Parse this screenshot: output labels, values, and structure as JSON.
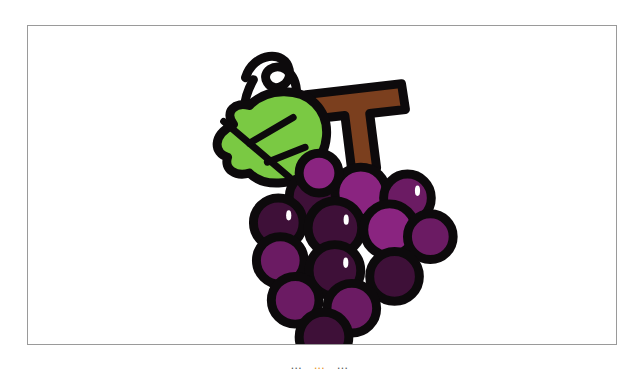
{
  "canvas": {
    "width": 639,
    "height": 373,
    "background_color": "#ffffff"
  },
  "image_card": {
    "name": "grape illustration card",
    "border_color": "#9a9a9a",
    "background_color": "#ffffff",
    "x": 27,
    "y": 25,
    "width": 590,
    "height": 320
  },
  "illustration": {
    "subject": "grapes",
    "style": "flat clipart with heavy black outline",
    "alt_text": "Bunch of purple grapes with a green leaf, curly tendril and brown T-shaped stem",
    "colors": {
      "outline": "#0d0a0c",
      "leaf_green": "#7ac943",
      "stem_brown": "#7b3f1e",
      "grape_dark": "#3e1038",
      "grape_mid": "#6b1b63",
      "grape_light": "#8a2480",
      "highlight": "#ffffff"
    },
    "parts": [
      {
        "label": "tendril",
        "color": "#0d0a0c"
      },
      {
        "label": "leaf",
        "color": "#7ac943"
      },
      {
        "label": "stem",
        "color": "#7b3f1e"
      },
      {
        "label": "grape cluster",
        "color": "#6b1b63"
      }
    ],
    "grapes": [
      {
        "cx": 286,
        "cy": 172,
        "r": 24,
        "tone": "grape_dark",
        "highlight": true
      },
      {
        "cx": 334,
        "cy": 168,
        "r": 26,
        "tone": "grape_light",
        "highlight": false
      },
      {
        "cx": 381,
        "cy": 173,
        "r": 24,
        "tone": "grape_mid",
        "highlight": true
      },
      {
        "cx": 251,
        "cy": 198,
        "r": 25,
        "tone": "grape_dark",
        "highlight": true
      },
      {
        "cx": 308,
        "cy": 203,
        "r": 27,
        "tone": "grape_dark",
        "highlight": true
      },
      {
        "cx": 363,
        "cy": 205,
        "r": 26,
        "tone": "grape_light",
        "highlight": false
      },
      {
        "cx": 404,
        "cy": 212,
        "r": 23,
        "tone": "grape_mid",
        "highlight": false
      },
      {
        "cx": 253,
        "cy": 236,
        "r": 24,
        "tone": "grape_mid",
        "highlight": false
      },
      {
        "cx": 308,
        "cy": 246,
        "r": 26,
        "tone": "grape_dark",
        "highlight": true
      },
      {
        "cx": 368,
        "cy": 252,
        "r": 25,
        "tone": "grape_dark",
        "highlight": false
      },
      {
        "cx": 268,
        "cy": 276,
        "r": 24,
        "tone": "grape_mid",
        "highlight": false
      },
      {
        "cx": 325,
        "cy": 284,
        "r": 25,
        "tone": "grape_mid",
        "highlight": false
      },
      {
        "cx": 297,
        "cy": 313,
        "r": 25,
        "tone": "grape_dark",
        "highlight": false
      },
      {
        "cx": 292,
        "cy": 148,
        "r": 20,
        "tone": "grape_light",
        "highlight": false
      }
    ]
  },
  "caption": {
    "segment_left": "...",
    "segment_accent": "...",
    "segment_right": "...",
    "accent_color": "#e8921a",
    "muted_color": "#555555",
    "note_visible": "clipped at bottom edge"
  }
}
